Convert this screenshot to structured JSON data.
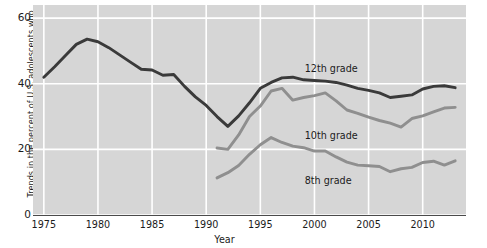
{
  "chart_data": {
    "type": "line",
    "title": "",
    "subtitle": "",
    "xlabel": "Year",
    "ylabel": "Trends in the percent of U.S. adolescents who\nhave used an illicit drug in the last 12 months",
    "xlim": [
      1974,
      2014
    ],
    "ylim": [
      0,
      64
    ],
    "xticks": [
      1975,
      1980,
      1985,
      1990,
      1995,
      2000,
      2005,
      2010
    ],
    "xticklabels": [
      "1975",
      "1980",
      "1985",
      "1990",
      "1995",
      "2000",
      "2005",
      "2010"
    ],
    "yticks": [
      0,
      20,
      40,
      60
    ],
    "yticklabels": [
      "0",
      "20",
      "40",
      "60"
    ],
    "grid": true,
    "grid_color": "#ffffff",
    "panel_color": "#d6d6d6",
    "legend": "inline-annotations",
    "series": [
      {
        "name": "12th grade",
        "color": "#3a3a3a",
        "label_x": 2001.5,
        "label_y": 44.5,
        "x": [
          1975,
          1976,
          1977,
          1978,
          1979,
          1980,
          1981,
          1982,
          1983,
          1984,
          1985,
          1986,
          1987,
          1988,
          1989,
          1990,
          1991,
          1992,
          1993,
          1994,
          1995,
          1996,
          1997,
          1998,
          1999,
          2000,
          2001,
          2002,
          2003,
          2004,
          2005,
          2006,
          2007,
          2008,
          2009,
          2010,
          2011,
          2012,
          2013
        ],
        "values": [
          42.0,
          45.2,
          48.6,
          52.0,
          53.6,
          52.8,
          51.0,
          48.8,
          46.6,
          44.4,
          44.2,
          42.6,
          42.8,
          39.2,
          36.0,
          33.4,
          30.0,
          27.0,
          30.2,
          34.2,
          38.6,
          40.4,
          41.8,
          42.0,
          41.2,
          41.0,
          40.8,
          40.4,
          39.6,
          38.6,
          38.0,
          37.2,
          35.8,
          36.2,
          36.6,
          38.4,
          39.2,
          39.4,
          38.8
        ]
      },
      {
        "name": "10th grade",
        "color": "#8f8f8f",
        "label_x": 2001.5,
        "label_y": 24.0,
        "x": [
          1991,
          1992,
          1993,
          1994,
          1995,
          1996,
          1997,
          1998,
          1999,
          2000,
          2001,
          2002,
          2003,
          2004,
          2005,
          2006,
          2007,
          2008,
          2009,
          2010,
          2011,
          2012,
          2013
        ],
        "values": [
          20.4,
          20.0,
          24.4,
          30.0,
          33.2,
          37.8,
          38.6,
          35.0,
          35.8,
          36.4,
          37.2,
          34.8,
          32.0,
          31.0,
          29.8,
          28.8,
          28.0,
          26.8,
          29.4,
          30.2,
          31.4,
          32.6,
          32.8
        ]
      },
      {
        "name": "8th grade",
        "color": "#8f8f8f",
        "label_x": 2001.5,
        "label_y": 10.5,
        "x": [
          1991,
          1992,
          1993,
          1994,
          1995,
          1996,
          1997,
          1998,
          1999,
          2000,
          2001,
          2002,
          2003,
          2004,
          2005,
          2006,
          2007,
          2008,
          2009,
          2010,
          2011,
          2012,
          2013
        ],
        "values": [
          11.3,
          12.9,
          15.1,
          18.5,
          21.4,
          23.6,
          22.1,
          21.0,
          20.5,
          19.5,
          19.5,
          17.7,
          16.1,
          15.2,
          15.0,
          14.8,
          13.2,
          14.1,
          14.5,
          16.0,
          16.4,
          15.2,
          16.5
        ]
      }
    ]
  },
  "axis": {
    "ytick_labels": [
      "0",
      "20",
      "40",
      "60"
    ],
    "xtick_labels": [
      "1975",
      "1980",
      "1985",
      "1990",
      "1995",
      "2000",
      "2005",
      "2010"
    ],
    "x_title": "Year",
    "y_title_line1": "Trends in the percent of U.S. adolescents who",
    "y_title_line2": "have used an illicit drug in the last 12 months"
  },
  "annotations": {
    "grade12": "12th grade",
    "grade10": "10th grade",
    "grade8": "8th grade"
  }
}
